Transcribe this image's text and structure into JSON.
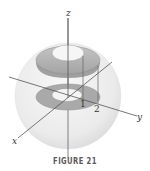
{
  "diagram": {
    "type": "3d-solid-illustration",
    "axes": {
      "x_label": "x",
      "y_label": "y",
      "z_label": "z"
    },
    "radial_ticks": [
      {
        "label": "1"
      },
      {
        "label": "2"
      }
    ],
    "colors": {
      "sphere_fill": "#ececec",
      "annulus_fill": "#a9a9a9",
      "upper_annulus_fill": "#b3b3b3",
      "hole_fill": "#f6f6f6",
      "axis_line": "#555555"
    }
  },
  "caption": "FIGURE 21"
}
